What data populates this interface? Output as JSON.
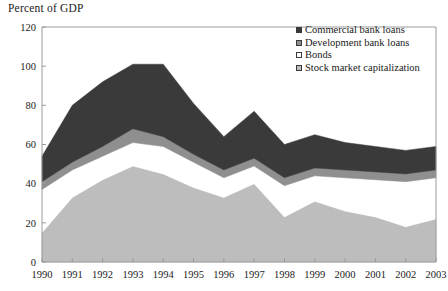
{
  "chart_data": {
    "type": "area",
    "stacked": true,
    "title": "Percent of GDP",
    "xlabel": "",
    "ylabel": "Percent of GDP",
    "ylim": [
      0,
      120
    ],
    "yticks": [
      0,
      20,
      40,
      60,
      80,
      100,
      120
    ],
    "grid": false,
    "legend_position": "top-right",
    "categories": [
      1990,
      1991,
      1992,
      1993,
      1994,
      1995,
      1996,
      1997,
      1998,
      1999,
      2000,
      2001,
      2002,
      2003
    ],
    "x": [
      "1990",
      "1991",
      "1992",
      "1993",
      "1994",
      "1995",
      "1996",
      "1997",
      "1998",
      "1999",
      "2000",
      "2001",
      "2002",
      "2003"
    ],
    "series": [
      {
        "name": "Stock market capitalization",
        "color": "#bdbdbd",
        "values": [
          15,
          33,
          42,
          49,
          45,
          38,
          33,
          40,
          23,
          31,
          26,
          23,
          18,
          22
        ]
      },
      {
        "name": "Bonds",
        "color": "#ffffff",
        "values": [
          22,
          14,
          12,
          12,
          14,
          13,
          10,
          9,
          16,
          13,
          17,
          19,
          23,
          21
        ]
      },
      {
        "name": "Development bank loans",
        "color": "#8f8f8f",
        "values": [
          4,
          4,
          5,
          7,
          5,
          4,
          4,
          4,
          4,
          4,
          4,
          4,
          4,
          4
        ]
      },
      {
        "name": "Commercial bank loans",
        "color": "#3a3a3a",
        "values": [
          13,
          29,
          33,
          33,
          37,
          26,
          17,
          24,
          17,
          17,
          14,
          13,
          12,
          12
        ]
      }
    ],
    "totals": [
      54,
      80,
      92,
      101,
      101,
      81,
      64,
      77,
      60,
      65,
      61,
      59,
      57,
      59
    ],
    "legend": [
      {
        "label": "Commercial bank loans",
        "color": "#3a3a3a"
      },
      {
        "label": "Development bank loans",
        "color": "#8f8f8f"
      },
      {
        "label": "Bonds",
        "color": "#ffffff"
      },
      {
        "label": "Stock market capitalization",
        "color": "#bdbdbd"
      }
    ]
  }
}
